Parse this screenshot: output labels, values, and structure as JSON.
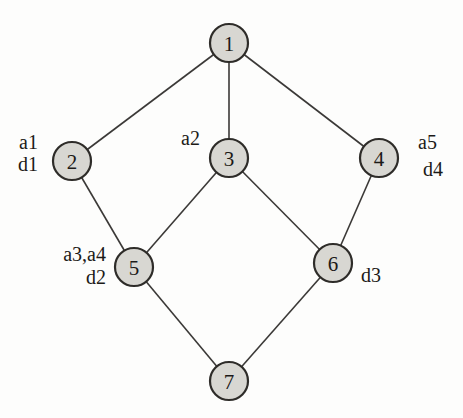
{
  "figure": {
    "type": "graph-diagram",
    "background": "#fdfdfc",
    "node_fill": "#d8d7d2",
    "node_stroke": "#2e2c29",
    "edge_color": "#3b3937",
    "text_color": "#1c1a18",
    "node_radius": 19,
    "node_stroke_width": 2.2,
    "edge_stroke_width": 1.6,
    "nodes": [
      {
        "id": "1",
        "label": "1",
        "x": 229,
        "y": 43
      },
      {
        "id": "2",
        "label": "2",
        "x": 72,
        "y": 161
      },
      {
        "id": "3",
        "label": "3",
        "x": 229,
        "y": 158
      },
      {
        "id": "4",
        "label": "4",
        "x": 379,
        "y": 158
      },
      {
        "id": "5",
        "label": "5",
        "x": 134,
        "y": 267
      },
      {
        "id": "6",
        "label": "6",
        "x": 333,
        "y": 263
      },
      {
        "id": "7",
        "label": "7",
        "x": 229,
        "y": 381
      }
    ],
    "edges": [
      {
        "from": "1",
        "to": "2"
      },
      {
        "from": "1",
        "to": "3"
      },
      {
        "from": "1",
        "to": "4"
      },
      {
        "from": "2",
        "to": "5"
      },
      {
        "from": "3",
        "to": "5"
      },
      {
        "from": "3",
        "to": "6"
      },
      {
        "from": "4",
        "to": "6"
      },
      {
        "from": "5",
        "to": "7"
      },
      {
        "from": "6",
        "to": "7"
      }
    ],
    "annotations": [
      {
        "id": "a1",
        "text": "a1",
        "x": 38,
        "y": 149,
        "anchor": "end",
        "near_node": "2"
      },
      {
        "id": "d1",
        "text": "d1",
        "x": 38,
        "y": 171,
        "anchor": "end",
        "near_node": "2"
      },
      {
        "id": "a2",
        "text": "a2",
        "x": 200,
        "y": 145,
        "anchor": "end",
        "near_node": "3"
      },
      {
        "id": "a5",
        "text": "a5",
        "x": 418,
        "y": 149,
        "anchor": "start",
        "near_node": "4"
      },
      {
        "id": "d4",
        "text": "d4",
        "x": 423,
        "y": 176,
        "anchor": "start",
        "near_node": "4"
      },
      {
        "id": "a3a4",
        "text": "a3,a4",
        "x": 106,
        "y": 261,
        "anchor": "end",
        "near_node": "5"
      },
      {
        "id": "d2",
        "text": "d2",
        "x": 106,
        "y": 284,
        "anchor": "end",
        "near_node": "5"
      },
      {
        "id": "d3",
        "text": "d3",
        "x": 361,
        "y": 282,
        "anchor": "start",
        "near_node": "6"
      }
    ]
  }
}
